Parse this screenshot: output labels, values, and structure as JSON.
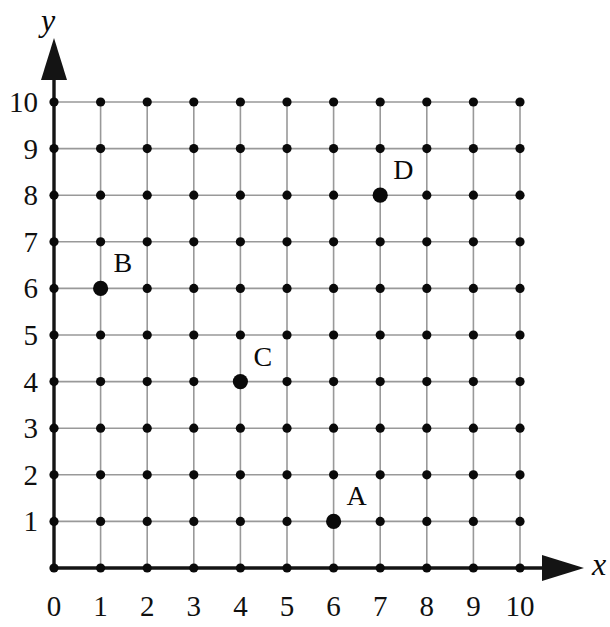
{
  "figure": {
    "kind": "coordinate-grid",
    "background_color": "#ffffff",
    "axis_color": "#141414",
    "grid_color": "#999999",
    "dot_color": "#0a0a0a"
  },
  "axes": {
    "x_name": "x",
    "y_name": "y",
    "x_ticks": [
      "0",
      "1",
      "2",
      "3",
      "4",
      "5",
      "6",
      "7",
      "8",
      "9",
      "10"
    ],
    "y_ticks": [
      "1",
      "2",
      "3",
      "4",
      "5",
      "6",
      "7",
      "8",
      "9",
      "10"
    ],
    "x_min": 0,
    "x_max": 10,
    "y_min": 0,
    "y_max": 10
  },
  "chart_data": {
    "type": "scatter",
    "title": "",
    "xlabel": "x",
    "ylabel": "y",
    "xlim": [
      0,
      10
    ],
    "ylim": [
      0,
      10
    ],
    "grid": true,
    "legend": "none",
    "lattice": {
      "description": "11 by 11 grid of evenly spaced dots at every integer coordinate",
      "x_values": [
        0,
        1,
        2,
        3,
        4,
        5,
        6,
        7,
        8,
        9,
        10
      ],
      "y_values": [
        0,
        1,
        2,
        3,
        4,
        5,
        6,
        7,
        8,
        9,
        10
      ]
    },
    "labeled_points": [
      {
        "label": "A",
        "x": 6,
        "y": 1
      },
      {
        "label": "B",
        "x": 1,
        "y": 6
      },
      {
        "label": "C",
        "x": 4,
        "y": 4
      },
      {
        "label": "D",
        "x": 7,
        "y": 8
      }
    ]
  }
}
